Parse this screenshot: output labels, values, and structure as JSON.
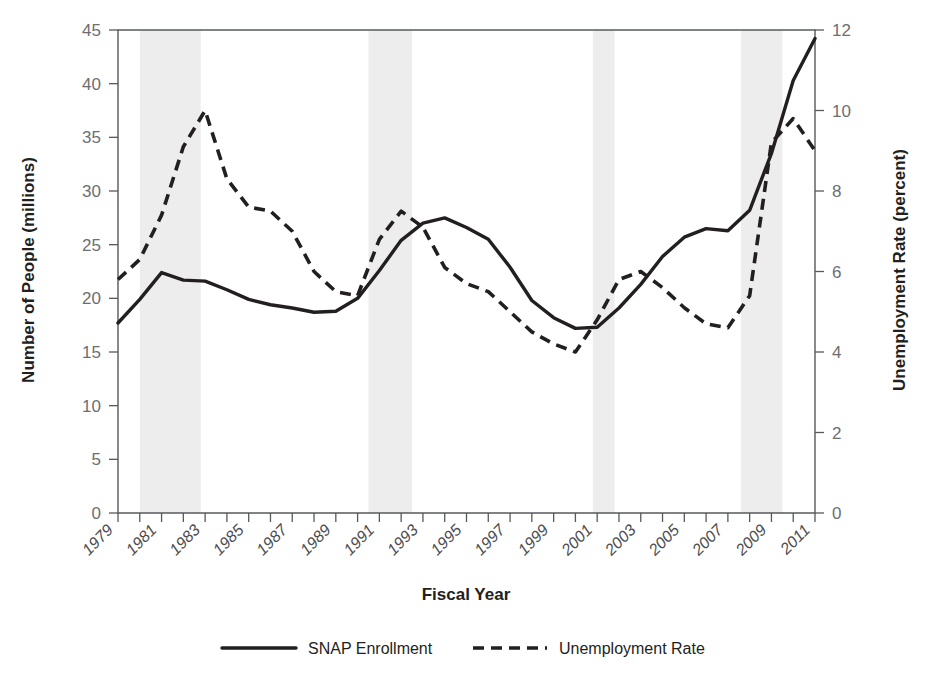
{
  "chart_data": {
    "type": "line",
    "title": "",
    "xlabel": "Fiscal Year",
    "ylabel": "Number of People (millions)",
    "y2label": "Unemployment Rate (percent)",
    "grid": false,
    "legend_position": "bottom-center",
    "xlim": [
      1979,
      2011
    ],
    "ylim": [
      0,
      45
    ],
    "y2lim": [
      0,
      12
    ],
    "x": [
      1979,
      1980,
      1981,
      1982,
      1983,
      1984,
      1985,
      1986,
      1987,
      1988,
      1989,
      1990,
      1991,
      1992,
      1993,
      1994,
      1995,
      1996,
      1997,
      1998,
      1999,
      2000,
      2001,
      2002,
      2003,
      2004,
      2005,
      2006,
      2007,
      2008,
      2009,
      2010,
      2011
    ],
    "xtick_labels": [
      "1979",
      "1981",
      "1983",
      "1985",
      "1987",
      "1989",
      "1991",
      "1993",
      "1995",
      "1997",
      "1999",
      "2001",
      "2003",
      "2005",
      "2007",
      "2009",
      "2011"
    ],
    "xtick_values": [
      1979,
      1981,
      1983,
      1985,
      1987,
      1989,
      1991,
      1993,
      1995,
      1997,
      1999,
      2001,
      2003,
      2005,
      2007,
      2009,
      2011
    ],
    "xtick_minor_values": [
      1980,
      1982,
      1984,
      1986,
      1988,
      1990,
      1992,
      1994,
      1996,
      1998,
      2000,
      2002,
      2004,
      2006,
      2008,
      2010
    ],
    "ytick_labels": [
      "0",
      "5",
      "10",
      "15",
      "20",
      "25",
      "30",
      "35",
      "40",
      "45"
    ],
    "ytick_values": [
      0,
      5,
      10,
      15,
      20,
      25,
      30,
      35,
      40,
      45
    ],
    "y2tick_labels": [
      "0",
      "2",
      "4",
      "6",
      "8",
      "10",
      "12"
    ],
    "y2tick_values": [
      0,
      2,
      4,
      6,
      8,
      10,
      12
    ],
    "series": [
      {
        "name": "SNAP Enrollment",
        "axis": "left",
        "style": "solid",
        "color": "#231f20",
        "values": [
          17.7,
          19.9,
          22.4,
          21.7,
          21.6,
          20.8,
          19.9,
          19.4,
          19.1,
          18.7,
          18.8,
          20.0,
          22.6,
          25.4,
          27.0,
          27.5,
          26.6,
          25.5,
          22.9,
          19.8,
          18.2,
          17.2,
          17.3,
          19.1,
          21.3,
          23.9,
          25.7,
          26.5,
          26.3,
          28.2,
          33.5,
          40.3,
          44.2
        ]
      },
      {
        "name": "Unemployment Rate",
        "axis": "right",
        "style": "dashed",
        "color": "#231f20",
        "values": [
          5.8,
          6.3,
          7.4,
          9.1,
          10.0,
          8.3,
          7.6,
          7.5,
          7.0,
          6.0,
          5.5,
          5.4,
          6.8,
          7.5,
          7.1,
          6.1,
          5.7,
          5.5,
          5.0,
          4.5,
          4.2,
          4.0,
          4.8,
          5.8,
          6.0,
          5.6,
          5.1,
          4.7,
          4.6,
          5.4,
          9.2,
          9.8,
          9.0
        ]
      }
    ],
    "recession_bands": [
      {
        "start": 1980.0,
        "end": 1982.8
      },
      {
        "start": 1990.5,
        "end": 1992.5
      },
      {
        "start": 2000.8,
        "end": 2001.8
      },
      {
        "start": 2007.6,
        "end": 2009.5
      }
    ],
    "recession_band_color": "#ededed",
    "axis_color": "#58595b",
    "tick_label_color": "#6d6e71"
  },
  "legend": {
    "items": [
      {
        "label": "SNAP Enrollment",
        "style": "solid"
      },
      {
        "label": "Unemployment Rate",
        "style": "dashed"
      }
    ]
  }
}
